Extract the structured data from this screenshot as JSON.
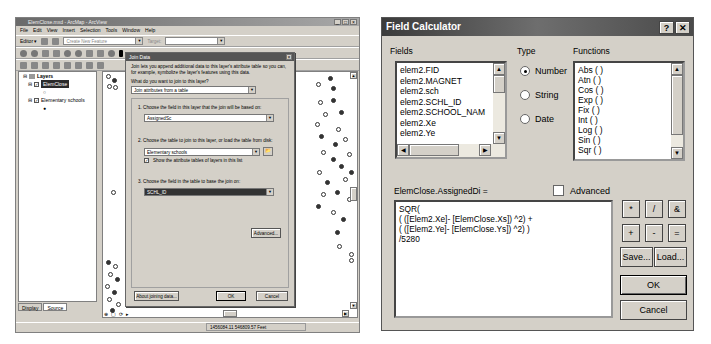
{
  "arcmap": {
    "title": "ElemClose.mxd - ArcMap - ArcView",
    "menu": [
      "File",
      "Edit",
      "View",
      "Insert",
      "Selection",
      "Tools",
      "Window",
      "Help"
    ],
    "editor_label": "Editor ▾",
    "task_combo": "Create New Feature",
    "target_label": "Target:",
    "toc": {
      "root": "Layers",
      "layers": [
        {
          "name": "ElemClose",
          "checked": true,
          "selected": true
        },
        {
          "name": "Elementary schools",
          "checked": true,
          "selected": false
        }
      ]
    },
    "toc_tabs": [
      "Display",
      "Source"
    ],
    "status_coords": "1456084.11  546809.57 Feet"
  },
  "join_dialog": {
    "title": "Join Data",
    "intro": "Join lets you append additional data to this layer's attribute table so you can, for example, symbolize the layer's features using this data.",
    "question": "What do you want to join to this layer?",
    "join_type": "Join attributes from a table",
    "step1_label": "1.  Choose the field in this layer that the join will be based on:",
    "step1_value": "AssignedSc",
    "step2_label": "2.  Choose the table to join to this layer, or load the table from disk:",
    "step2_value": "Elementary schools",
    "show_layers_label": "Show the attribute tables of layers in this list",
    "show_layers_checked": true,
    "step3_label": "3.  Choose the field in the table to base the join on:",
    "step3_value": "SCHL_ID",
    "advanced_button": "Advanced...",
    "about_button": "About joining data...",
    "ok_button": "OK",
    "cancel_button": "Cancel"
  },
  "field_calculator": {
    "title": "Field Calculator",
    "help_button": "?",
    "close_button": "✕",
    "fields_label": "Fields",
    "fields": [
      "elem2.FID",
      "elem2.MAGNET",
      "elem2.sch",
      "elem2.SCHL_ID",
      "elem2.SCHOOL_NAM",
      "elem2.Xe",
      "elem2.Ye"
    ],
    "type_label": "Type",
    "types": [
      {
        "label": "Number",
        "selected": true
      },
      {
        "label": "String",
        "selected": false
      },
      {
        "label": "Date",
        "selected": false
      }
    ],
    "functions_label": "Functions",
    "functions": [
      "Abs ( )",
      "Atn ( )",
      "Cos ( )",
      "Exp ( )",
      "Fix ( )",
      "Int ( )",
      "Log ( )",
      "Sin ( )",
      "Sqr ( )"
    ],
    "target_field_label": "ElemClose.AssignedDi =",
    "advanced_label": "Advanced",
    "advanced_checked": false,
    "expression": "SQR(\n( ([Elem2.Xe]- [ElemClose.Xs]) ^2) +\n( ([Elem2.Ye]- [ElemClose.Ys]) ^2) )\n/5280",
    "operators": [
      "*",
      "/",
      "&",
      "+",
      "-",
      "="
    ],
    "save_button": "Save...",
    "load_button": "Load...",
    "ok_button": "OK",
    "cancel_button": "Cancel"
  }
}
